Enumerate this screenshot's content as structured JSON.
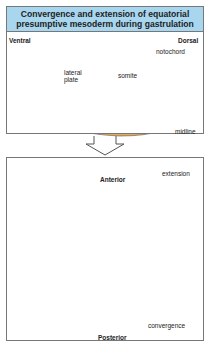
{
  "top_panel": {
    "title_line1": "Convergence and extension of equatorial",
    "title_line2": "presumptive mesoderm during gastrulation",
    "ventral": "Ventral",
    "dorsal": "Dorsal",
    "notochord": "notochord",
    "lateral_plate_1": "lateral",
    "lateral_plate_2": "plate",
    "somite": "somite",
    "midline": "midline",
    "markers": {
      "a": "A",
      "b": "B",
      "c": "C",
      "d": "D"
    }
  },
  "bottom_panel": {
    "anterior": "Anterior",
    "posterior": "Posterior",
    "extension": "extension",
    "convergence": "convergence",
    "markers": {
      "a": "A",
      "b": "B",
      "c": "C"
    }
  },
  "colors": {
    "title_bg": "#a8d6ee",
    "grey": "#d9d9d9",
    "lateral": "#f6eea0",
    "somite": "#e8a95a",
    "notochord": "#c9401a",
    "midline_red": "#e05020",
    "arrow": "#cfe6f4"
  }
}
